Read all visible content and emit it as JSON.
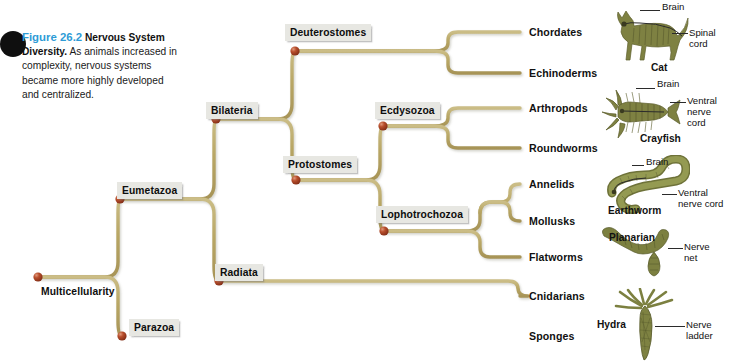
{
  "figure": {
    "number": "Figure 26.2",
    "title": "Nervous System Diversity.",
    "body": "As animals increased in complexity, nervous systems became more highly developed and centralized.",
    "accent_color": "#2e9bd6"
  },
  "colors": {
    "branch": "#baa96a",
    "branch_shadow": "#d8cfae",
    "node": "#9c3a22",
    "node_highlight": "#d4714f",
    "label_box": "#e7e7e2",
    "text": "#111111",
    "organism": "#7d8040"
  },
  "tree": {
    "type": "phylogenetic-cladogram",
    "root": "Multicellularity",
    "nodes": [
      {
        "id": "multicellularity",
        "label": "Multicellularity",
        "x": 38,
        "y": 277
      },
      {
        "id": "eumetazoa",
        "label": "Eumetazoa",
        "x": 120,
        "y": 199
      },
      {
        "id": "parazoa",
        "label": "Parazoa",
        "x": 122,
        "y": 336
      },
      {
        "id": "bilateria",
        "label": "Bilateria",
        "x": 216,
        "y": 119
      },
      {
        "id": "radiata",
        "label": "Radiata",
        "x": 219,
        "y": 281
      },
      {
        "id": "deuterostomes",
        "label": "Deuterostomes",
        "x": 295,
        "y": 51
      },
      {
        "id": "protostomes",
        "label": "Protostomes",
        "x": 296,
        "y": 180
      },
      {
        "id": "ecdysozoa",
        "label": "Ecdysozoa",
        "x": 383,
        "y": 126
      },
      {
        "id": "lophotrochozoa",
        "label": "Lophotrochozoa",
        "x": 384,
        "y": 231
      }
    ],
    "taxa": [
      {
        "id": "chordates",
        "label": "Chordates",
        "y": 32,
        "parent": "deuterostomes"
      },
      {
        "id": "echinoderms",
        "label": "Echinoderms",
        "y": 73,
        "parent": "deuterostomes"
      },
      {
        "id": "arthropods",
        "label": "Arthropods",
        "y": 108,
        "parent": "ecdysozoa"
      },
      {
        "id": "roundworms",
        "label": "Roundworms",
        "y": 148,
        "parent": "ecdysozoa"
      },
      {
        "id": "annelids",
        "label": "Annelids",
        "y": 184,
        "parent": "lophotrochozoa"
      },
      {
        "id": "mollusks",
        "label": "Mollusks",
        "y": 221,
        "parent": "lophotrochozoa"
      },
      {
        "id": "flatworms",
        "label": "Flatworms",
        "y": 257,
        "parent": "lophotrochozoa"
      },
      {
        "id": "cnidarians",
        "label": "Cnidarians",
        "y": 296,
        "parent": "radiata"
      },
      {
        "id": "sponges",
        "label": "Sponges",
        "y": 336,
        "parent": "parazoa"
      }
    ]
  },
  "organisms": [
    {
      "id": "cat",
      "name": "Cat",
      "taxon": "chordates",
      "annotations": [
        {
          "label": "Brain",
          "text": "Brain"
        },
        {
          "label": "Spinal cord",
          "text": "Spinal\ncord"
        }
      ]
    },
    {
      "id": "crayfish",
      "name": "Crayfish",
      "taxon": "arthropods",
      "annotations": [
        {
          "label": "Brain",
          "text": "Brain"
        },
        {
          "label": "Ventral nerve cord",
          "text": "Ventral\nnerve\ncord"
        }
      ]
    },
    {
      "id": "earthworm",
      "name": "Earthworm",
      "taxon": "annelids",
      "annotations": [
        {
          "label": "Brain",
          "text": "Brain"
        },
        {
          "label": "Ventral nerve cord",
          "text": "Ventral\nnerve cord"
        }
      ]
    },
    {
      "id": "planarian",
      "name": "Planarian",
      "taxon": "flatworms",
      "annotations": [
        {
          "label": "Nerve ladder",
          "text": "Nerve\nladder"
        }
      ]
    },
    {
      "id": "hydra",
      "name": "Hydra",
      "taxon": "cnidarians",
      "annotations": [
        {
          "label": "Nerve net",
          "text": "Nerve\nnet"
        }
      ]
    }
  ]
}
